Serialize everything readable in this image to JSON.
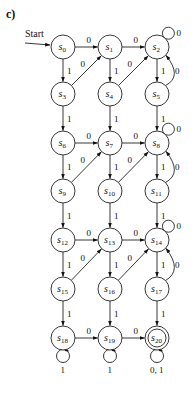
{
  "figure": {
    "part_label": "c)",
    "start_label": "Start",
    "width": 196,
    "height": 396
  },
  "layout": {
    "columns_x": [
      63,
      110,
      157
    ],
    "rows_y": [
      47,
      94,
      143,
      191,
      240,
      289,
      338
    ],
    "node_radius": 12
  },
  "nodes": [
    {
      "id": "s0",
      "name": "s",
      "sub": "0",
      "col": 0,
      "row": 0,
      "start": true
    },
    {
      "id": "s1",
      "name": "s",
      "sub": "1",
      "col": 1,
      "row": 0
    },
    {
      "id": "s2",
      "name": "s",
      "sub": "2",
      "col": 2,
      "row": 0
    },
    {
      "id": "s3",
      "name": "s",
      "sub": "3",
      "col": 0,
      "row": 1
    },
    {
      "id": "s4",
      "name": "s",
      "sub": "4",
      "col": 1,
      "row": 1
    },
    {
      "id": "s5",
      "name": "s",
      "sub": "5",
      "col": 2,
      "row": 1
    },
    {
      "id": "s6",
      "name": "s",
      "sub": "6",
      "col": 0,
      "row": 2
    },
    {
      "id": "s7",
      "name": "s",
      "sub": "7",
      "col": 1,
      "row": 2
    },
    {
      "id": "s8",
      "name": "s",
      "sub": "8",
      "col": 2,
      "row": 2
    },
    {
      "id": "s9",
      "name": "s",
      "sub": "9",
      "col": 0,
      "row": 3
    },
    {
      "id": "s10",
      "name": "s",
      "sub": "10",
      "col": 1,
      "row": 3
    },
    {
      "id": "s11",
      "name": "s",
      "sub": "11",
      "col": 2,
      "row": 3
    },
    {
      "id": "s12",
      "name": "s",
      "sub": "12",
      "col": 0,
      "row": 4
    },
    {
      "id": "s13",
      "name": "s",
      "sub": "13",
      "col": 1,
      "row": 4
    },
    {
      "id": "s14",
      "name": "s",
      "sub": "14",
      "col": 2,
      "row": 4
    },
    {
      "id": "s15",
      "name": "s",
      "sub": "15",
      "col": 0,
      "row": 5
    },
    {
      "id": "s16",
      "name": "s",
      "sub": "16",
      "col": 1,
      "row": 5
    },
    {
      "id": "s17",
      "name": "s",
      "sub": "17",
      "col": 2,
      "row": 5
    },
    {
      "id": "s18",
      "name": "s",
      "sub": "18",
      "col": 0,
      "row": 6
    },
    {
      "id": "s19",
      "name": "s",
      "sub": "19",
      "col": 1,
      "row": 6
    },
    {
      "id": "s20",
      "name": "s",
      "sub": "20",
      "col": 2,
      "row": 6,
      "accepting": true
    }
  ],
  "edges": [
    {
      "from": "s0",
      "to": "s1",
      "label": "0",
      "kind": "straight"
    },
    {
      "from": "s1",
      "to": "s2",
      "label": "0",
      "kind": "straight"
    },
    {
      "from": "s0",
      "to": "s3",
      "label": "1",
      "kind": "straight"
    },
    {
      "from": "s1",
      "to": "s4",
      "label": "1",
      "kind": "straight"
    },
    {
      "from": "s2",
      "to": "s5",
      "label": "1",
      "kind": "straight"
    },
    {
      "from": "s3",
      "to": "s1",
      "label": "0",
      "kind": "straight"
    },
    {
      "from": "s4",
      "to": "s2",
      "label": "0",
      "kind": "straight"
    },
    {
      "from": "s5",
      "to": "s2",
      "label": "0",
      "kind": "curve"
    },
    {
      "from": "s2",
      "to": "s2",
      "label": "0",
      "kind": "loop-top"
    },
    {
      "from": "s3",
      "to": "s6",
      "label": "1",
      "kind": "straight"
    },
    {
      "from": "s4",
      "to": "s7",
      "label": "1",
      "kind": "straight"
    },
    {
      "from": "s5",
      "to": "s8",
      "label": "1",
      "kind": "straight"
    },
    {
      "from": "s6",
      "to": "s7",
      "label": "0",
      "kind": "straight"
    },
    {
      "from": "s7",
      "to": "s8",
      "label": "0",
      "kind": "straight"
    },
    {
      "from": "s6",
      "to": "s9",
      "label": "1",
      "kind": "straight"
    },
    {
      "from": "s7",
      "to": "s10",
      "label": "1",
      "kind": "straight"
    },
    {
      "from": "s8",
      "to": "s11",
      "label": "1",
      "kind": "straight"
    },
    {
      "from": "s9",
      "to": "s7",
      "label": "0",
      "kind": "straight"
    },
    {
      "from": "s10",
      "to": "s8",
      "label": "0",
      "kind": "straight"
    },
    {
      "from": "s11",
      "to": "s8",
      "label": "0",
      "kind": "curve"
    },
    {
      "from": "s8",
      "to": "s8",
      "label": "0",
      "kind": "loop-top"
    },
    {
      "from": "s9",
      "to": "s12",
      "label": "1",
      "kind": "straight"
    },
    {
      "from": "s10",
      "to": "s13",
      "label": "1",
      "kind": "straight"
    },
    {
      "from": "s11",
      "to": "s14",
      "label": "1",
      "kind": "straight"
    },
    {
      "from": "s12",
      "to": "s13",
      "label": "0",
      "kind": "straight"
    },
    {
      "from": "s13",
      "to": "s14",
      "label": "0",
      "kind": "straight"
    },
    {
      "from": "s12",
      "to": "s15",
      "label": "1",
      "kind": "straight"
    },
    {
      "from": "s13",
      "to": "s16",
      "label": "1",
      "kind": "straight"
    },
    {
      "from": "s14",
      "to": "s17",
      "label": "1",
      "kind": "straight"
    },
    {
      "from": "s15",
      "to": "s13",
      "label": "0",
      "kind": "straight"
    },
    {
      "from": "s16",
      "to": "s14",
      "label": "0",
      "kind": "straight"
    },
    {
      "from": "s17",
      "to": "s14",
      "label": "0",
      "kind": "curve"
    },
    {
      "from": "s14",
      "to": "s14",
      "label": "0",
      "kind": "loop-top"
    },
    {
      "from": "s15",
      "to": "s18",
      "label": "1",
      "kind": "straight"
    },
    {
      "from": "s16",
      "to": "s19",
      "label": "1",
      "kind": "straight"
    },
    {
      "from": "s17",
      "to": "s20",
      "label": "1",
      "kind": "straight"
    },
    {
      "from": "s18",
      "to": "s19",
      "label": "0",
      "kind": "straight"
    },
    {
      "from": "s19",
      "to": "s20",
      "label": "0",
      "kind": "straight"
    },
    {
      "from": "s18",
      "to": "s18",
      "label": "1",
      "kind": "loop-bottom"
    },
    {
      "from": "s19",
      "to": "s19",
      "label": "1",
      "kind": "loop-bottom"
    },
    {
      "from": "s20",
      "to": "s20",
      "label": "0, 1",
      "kind": "loop-bottom"
    }
  ]
}
